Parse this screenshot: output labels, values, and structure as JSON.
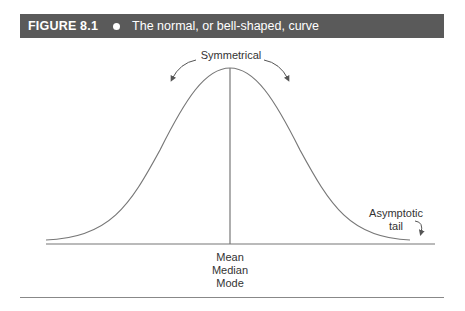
{
  "figure": {
    "number_label": "FIGURE 8.1",
    "bullet_icon": "bullet-dot-icon",
    "title": "The normal, or bell-shaped, curve"
  },
  "labels": {
    "top": "Symmetrical",
    "center_lines": [
      "Mean",
      "Median",
      "Mode"
    ],
    "tail_lines": [
      "Asymptotic",
      "tail"
    ]
  },
  "colors": {
    "banner_bg": "#5a5a5a",
    "banner_text": "#ffffff",
    "curve": "#777777",
    "text": "#333333"
  },
  "icons": [
    "curved-arrow-left-icon",
    "curved-arrow-right-icon",
    "tail-arrow-icon"
  ]
}
